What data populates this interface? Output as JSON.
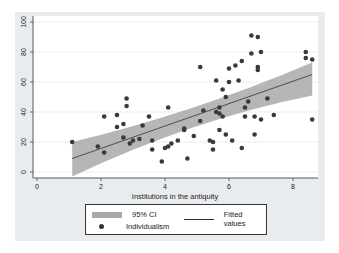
{
  "chart_data": {
    "type": "scatter",
    "title": "",
    "xlabel": "Institutions in the antiquity",
    "ylabel": "",
    "xlim": [
      0,
      8.6
    ],
    "ylim": [
      0,
      100
    ],
    "xticks": [
      0,
      2,
      4,
      6,
      8
    ],
    "yticks": [
      0,
      20,
      40,
      60,
      80,
      100
    ],
    "grid": true,
    "legend_position": "bottom",
    "legend": [
      "95% CI",
      "Fitted values",
      "Individualism"
    ],
    "series": [
      {
        "name": "Individualism",
        "kind": "points",
        "points": [
          [
            1.1,
            20
          ],
          [
            1.9,
            17
          ],
          [
            2.1,
            13
          ],
          [
            2.1,
            37
          ],
          [
            2.5,
            38
          ],
          [
            2.5,
            30
          ],
          [
            2.7,
            32
          ],
          [
            2.7,
            23
          ],
          [
            2.8,
            49
          ],
          [
            2.8,
            44
          ],
          [
            2.9,
            19
          ],
          [
            3.0,
            21
          ],
          [
            3.2,
            22
          ],
          [
            3.3,
            31
          ],
          [
            3.5,
            37
          ],
          [
            3.6,
            15
          ],
          [
            3.6,
            21
          ],
          [
            3.9,
            7
          ],
          [
            4.0,
            16
          ],
          [
            4.1,
            17
          ],
          [
            4.1,
            43
          ],
          [
            4.2,
            19
          ],
          [
            4.4,
            21
          ],
          [
            4.6,
            28
          ],
          [
            4.6,
            29
          ],
          [
            4.7,
            9
          ],
          [
            4.9,
            24
          ],
          [
            5.1,
            34
          ],
          [
            5.1,
            70
          ],
          [
            5.2,
            41
          ],
          [
            5.4,
            21
          ],
          [
            5.5,
            20
          ],
          [
            5.5,
            15
          ],
          [
            5.6,
            40
          ],
          [
            5.6,
            61
          ],
          [
            5.7,
            39
          ],
          [
            5.7,
            28
          ],
          [
            5.7,
            43
          ],
          [
            5.8,
            37
          ],
          [
            5.8,
            55
          ],
          [
            5.9,
            25
          ],
          [
            5.9,
            50
          ],
          [
            6.0,
            60
          ],
          [
            6.0,
            69
          ],
          [
            6.1,
            21
          ],
          [
            6.2,
            71
          ],
          [
            6.3,
            61
          ],
          [
            6.4,
            74
          ],
          [
            6.4,
            16
          ],
          [
            6.5,
            43
          ],
          [
            6.5,
            37
          ],
          [
            6.6,
            47
          ],
          [
            6.7,
            91
          ],
          [
            6.9,
            90
          ],
          [
            6.7,
            79
          ],
          [
            7.0,
            80
          ],
          [
            6.9,
            70
          ],
          [
            6.9,
            68
          ],
          [
            6.8,
            37
          ],
          [
            6.8,
            25
          ],
          [
            7.0,
            35
          ],
          [
            7.2,
            49
          ],
          [
            7.4,
            38
          ],
          [
            8.4,
            80
          ],
          [
            8.4,
            76
          ],
          [
            8.6,
            75
          ],
          [
            8.6,
            35
          ]
        ]
      },
      {
        "name": "Fitted values",
        "kind": "line",
        "x": [
          1.1,
          8.6
        ],
        "y": [
          9,
          65
        ]
      },
      {
        "name": "95% CI",
        "kind": "band",
        "x": [
          1.1,
          8.6
        ],
        "lower": [
          -3,
          51
        ],
        "upper": [
          20,
          73
        ]
      }
    ]
  },
  "legend": {
    "ci_label": "95% CI",
    "fitted_label": "Fitted values",
    "points_label": "Individualism"
  },
  "colors": {
    "background": "#e9ecef",
    "plot_area": "#ffffff",
    "points": "#3a3a3a",
    "ci_band": "#a9a9a9",
    "fitted_line": "#333333"
  }
}
